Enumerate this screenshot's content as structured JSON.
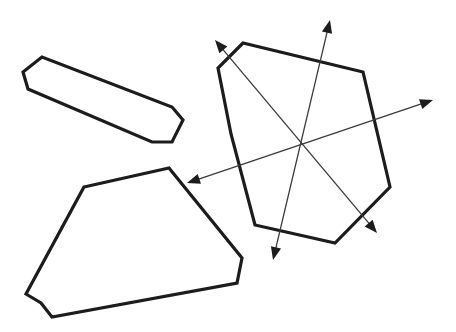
{
  "figure": {
    "canvas": {
      "width": 456,
      "height": 332
    },
    "background_color": "#ffffff",
    "outline_color": "#1c1c1c",
    "axis_color": "#3a3a3a",
    "outline_width": 3.2,
    "axis_width": 1.3
  },
  "shapes": [
    {
      "name": "elongated-hexagon",
      "label": "Elongated hexagon",
      "vertex_count": 7,
      "points": "42,57 23,72 28,89 152,142 172,142 183,120 172,107",
      "closed": true
    },
    {
      "name": "trapezoid-pentagon",
      "label": "Trapezoid-like pentagon",
      "vertex_count": 7,
      "points": "84,187 169,168 242,258 237,283 52,317 41,303 26,294",
      "closed": true
    },
    {
      "name": "large-heptagon",
      "label": "Large heptagon",
      "vertex_count": 7,
      "points": "243,43 218,68 231,134 255,225 335,243 390,187 363,72",
      "closed": true
    }
  ],
  "axes": [
    {
      "name": "axis-diagonal-ne",
      "label": "Diagonal axis upper-left to lower-right",
      "start": {
        "x": 215,
        "y": 40
      },
      "end": {
        "x": 377,
        "y": 233
      },
      "double_headed": true
    },
    {
      "name": "axis-vertical",
      "label": "Near-vertical axis",
      "start": {
        "x": 330,
        "y": 20
      },
      "end": {
        "x": 273,
        "y": 260
      },
      "double_headed": true
    },
    {
      "name": "axis-horizontal",
      "label": "Near-horizontal axis",
      "start": {
        "x": 433,
        "y": 100
      },
      "end": {
        "x": 187,
        "y": 183
      },
      "double_headed": true
    }
  ],
  "center_point": {
    "name": "axes-intersection",
    "x": 300,
    "y": 143
  }
}
